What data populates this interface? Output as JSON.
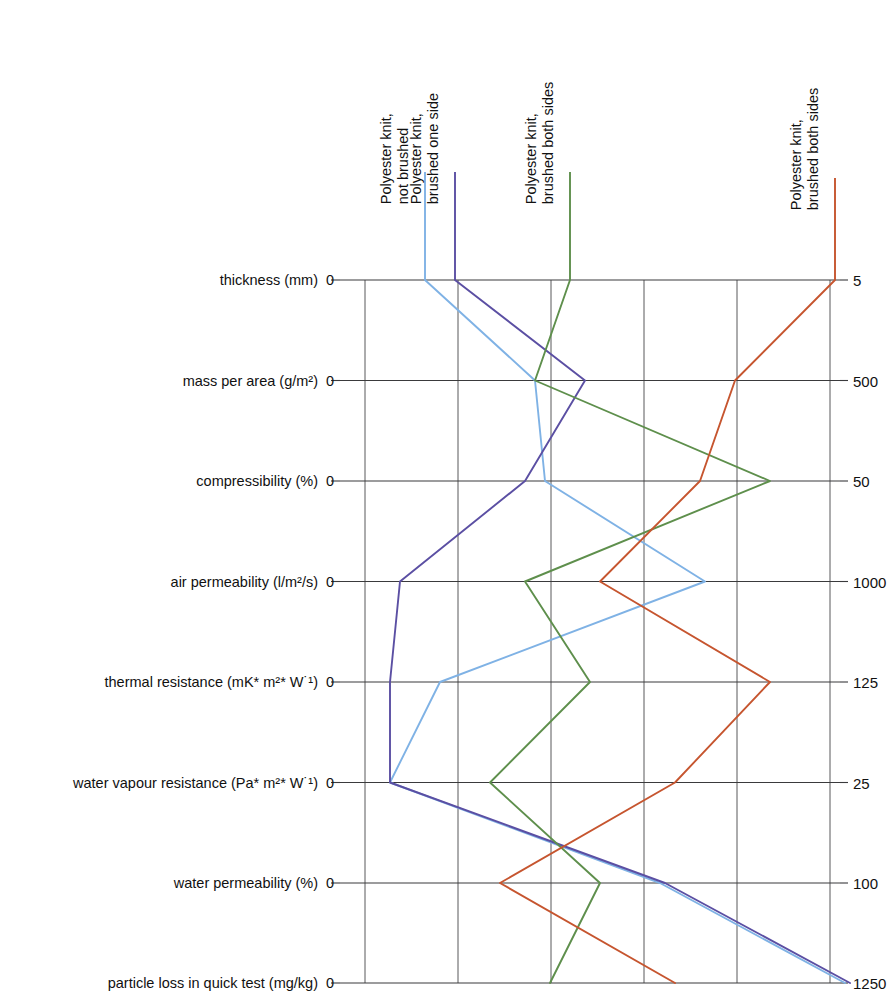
{
  "chart_data": {
    "type": "line",
    "title": "",
    "subtitle": "",
    "xlabel": "",
    "ylabel": "",
    "orientation": "horizontal-parallel-axes",
    "grid": true,
    "legend_position": "top, rotated labels above each series start",
    "note": "Each property row is its own horizontal axis running from 0 (left) to the right-hand maximum value.",
    "categories": [
      "thickness (mm)",
      "mass per area (g/m²)",
      "compressibility (%)",
      "air permeability (l/m²/s)",
      "thermal resistance  (mK* m²* W˙¹)",
      "water vapour resistance (Pa* m²* W˙¹)",
      "water permeability (%)",
      "particle loss in quick test (mg/kg)"
    ],
    "axis_min_labels": [
      "0",
      "0",
      "0",
      "0",
      "0",
      "0",
      "0",
      "0"
    ],
    "axis_max_labels": [
      "5",
      "500",
      "50",
      "1000",
      "125",
      "25",
      "100",
      "1250"
    ],
    "axis_max_values": [
      5,
      500,
      50,
      1000,
      125,
      25,
      100,
      1250
    ],
    "series": [
      {
        "name": "Polyester knit, not brushed",
        "color": "#7FB2E5",
        "values": [
          0.85,
          1.95,
          2.05,
          3.65,
          1.0,
          0.5,
          3.2,
          5.05
        ],
        "fractions": [
          0.17,
          0.39,
          0.41,
          0.73,
          0.2,
          0.1,
          0.64,
          1.01
        ],
        "real_values": [
          0.85,
          195,
          20.5,
          730,
          25,
          2.5,
          64,
          1260
        ]
      },
      {
        "name": "Polyester knit, brushed one side",
        "color": "#5B4FA3",
        "values": [
          1.15,
          2.45,
          1.85,
          0.6,
          0.5,
          0.5,
          3.25,
          5.1
        ],
        "fractions": [
          0.23,
          0.49,
          0.37,
          0.12,
          0.1,
          0.1,
          0.65,
          1.02
        ],
        "real_values": [
          1.15,
          245,
          18.5,
          120,
          12.5,
          2.5,
          65,
          1275
        ]
      },
      {
        "name": "Polyester knit, brushed both sides",
        "color": "#5E8F4C",
        "values": [
          2.3,
          1.95,
          4.3,
          1.85,
          2.5,
          1.5,
          2.6,
          2.1
        ],
        "fractions": [
          0.46,
          0.39,
          0.86,
          0.37,
          0.5,
          0.3,
          0.52,
          0.42
        ],
        "real_values": [
          2.3,
          195,
          43,
          370,
          62.5,
          7.5,
          52,
          525
        ]
      },
      {
        "name": "Polyester knit, brushed both sides",
        "color": "#C6552F",
        "values": [
          4.95,
          3.95,
          3.6,
          2.6,
          4.3,
          3.35,
          1.6,
          3.35
        ],
        "fractions": [
          0.99,
          0.79,
          0.72,
          0.52,
          0.86,
          0.67,
          0.32,
          0.67
        ],
        "real_values": [
          4.95,
          395,
          36,
          520,
          107.5,
          16.75,
          32,
          840
        ]
      }
    ]
  },
  "axes": {
    "rows": [
      {
        "label": "thickness (mm)",
        "zero": "0",
        "max": "5"
      },
      {
        "label": "mass per area (g/m²)",
        "zero": "0",
        "max": "500"
      },
      {
        "label": "compressibility (%)",
        "zero": "0",
        "max": "50"
      },
      {
        "label": "air permeability (l/m²/s)",
        "zero": "0",
        "max": "1000"
      },
      {
        "label": "thermal resistance  (mK* m²* W˙¹)",
        "zero": "0",
        "max": "125"
      },
      {
        "label": "water vapour resistance (Pa* m²* W˙¹)",
        "zero": "0",
        "max": "25"
      },
      {
        "label": "water permeability (%)",
        "zero": "0",
        "max": "100"
      },
      {
        "label": "particle loss in quick test (mg/kg)",
        "zero": "0",
        "max": "1250"
      }
    ]
  },
  "series_labels": [
    {
      "line1": "Polyester knit,",
      "line2": "not brushed"
    },
    {
      "line1": "Polyester knit,",
      "line2": "brushed one side"
    },
    {
      "line1": "Polyester knit,",
      "line2": "brushed both sides"
    },
    {
      "line1": "Polyester knit,",
      "line2": "brushed both sides"
    }
  ],
  "colors": {
    "series1": "#7FB2E5",
    "series2": "#5B4FA3",
    "series3": "#5E8F4C",
    "series4": "#C6552F",
    "grid": "#58585a",
    "axis": "#3a3a3c",
    "text": "#111111",
    "background": "#ffffff"
  }
}
